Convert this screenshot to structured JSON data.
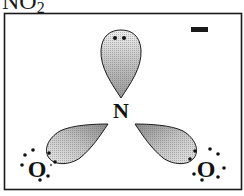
{
  "title": {
    "formula_main": "NO",
    "formula_subscript": "2"
  },
  "diagram": {
    "charge": "−",
    "central_atom": "N",
    "left_atom": "O",
    "right_atom": "O",
    "lobes": [
      {
        "name": "top-lone-pair-lobe",
        "electrons": 2
      },
      {
        "name": "left-bonding-lobe",
        "electrons": 2
      },
      {
        "name": "right-bonding-lobe",
        "electrons": 2
      }
    ],
    "oxygen_lone_electrons_each": 6,
    "colors": {
      "border": "#1a1a1a",
      "lobe_fill_dark": "#8a8a8a",
      "lobe_fill_light": "#e6e6e6",
      "electron": "#111111"
    }
  }
}
